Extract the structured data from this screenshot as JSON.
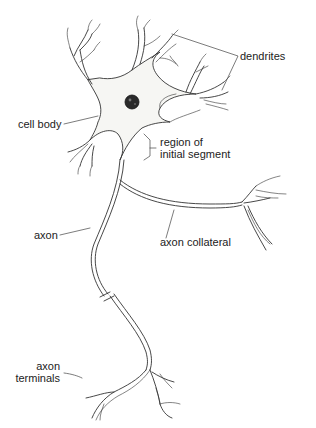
{
  "diagram": {
    "labels": {
      "dendrites": "dendrites",
      "cell_body": "cell body",
      "region_line1": "region of",
      "region_line2": "initial segment",
      "axon": "axon",
      "axon_collateral": "axon collateral",
      "axon_terminals_line1": "axon",
      "axon_terminals_line2": "terminals"
    },
    "colors": {
      "stroke": "#333333",
      "cell_fill": "#f6f6f3",
      "nucleus": "#2a2a2a",
      "text": "#222222"
    }
  }
}
